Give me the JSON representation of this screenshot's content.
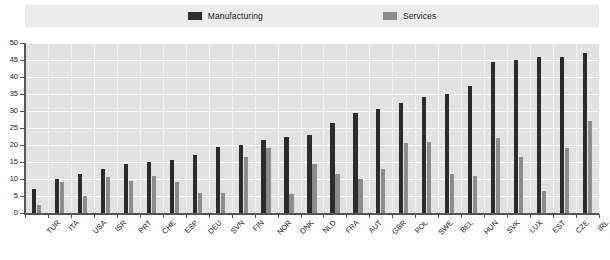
{
  "legend": {
    "entries": [
      {
        "label": "Manufacturing",
        "color": "#2b2b2b",
        "icon": "square-swatch-icon"
      },
      {
        "label": "Services",
        "color": "#8c8c8c",
        "icon": "square-swatch-icon"
      }
    ]
  },
  "chart_data": {
    "type": "bar",
    "title": "",
    "subtitle": "",
    "xlabel": "",
    "ylabel": "",
    "ylim": [
      0,
      50
    ],
    "yticks": [
      0,
      5,
      10,
      15,
      20,
      25,
      30,
      35,
      40,
      45,
      50
    ],
    "grid": true,
    "legend_position": "top",
    "categories": [
      "TUR",
      "ITA",
      "USA",
      "ISR",
      "PRT",
      "CHE",
      "ESP",
      "DEU",
      "SVN",
      "FIN",
      "NOR",
      "DNK",
      "NLD",
      "FRA",
      "AUT",
      "GBR",
      "POL",
      "SWE",
      "BEL",
      "HUN",
      "SVK",
      "LUX",
      "EST",
      "CZE",
      "IRL"
    ],
    "series": [
      {
        "name": "Manufacturing",
        "color": "#2b2b2b",
        "values": [
          7,
          10,
          11.5,
          13,
          14.5,
          15,
          15.5,
          17,
          19.5,
          20,
          21.5,
          22.5,
          23,
          26.5,
          29.5,
          30.5,
          32.5,
          34,
          35,
          37.5,
          44.5,
          45,
          46,
          46,
          47
        ]
      },
      {
        "name": "Services",
        "color": "#8c8c8c",
        "values": [
          2.5,
          9,
          5,
          10.5,
          9.5,
          11,
          9,
          6,
          6,
          16.5,
          19,
          5.5,
          14.5,
          11.5,
          10,
          13,
          20.5,
          21,
          11.5,
          11,
          22,
          16.5,
          6.5,
          19,
          27
        ]
      }
    ]
  },
  "colors": {
    "plot_background": "#e2e2e2",
    "legend_background": "#ececec",
    "gridline": "#ffffff",
    "axis": "#555555",
    "text": "#1a1a1a"
  }
}
